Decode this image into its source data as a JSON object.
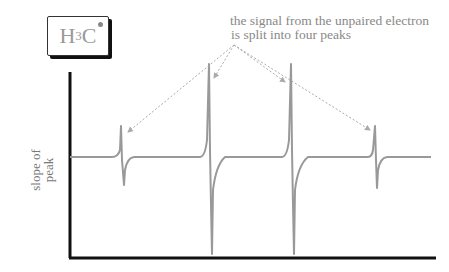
{
  "label": {
    "main": "H",
    "sub": "3",
    "tail": "C",
    "radical": "•"
  },
  "annotation": {
    "line1": "the signal from the unpaired electron",
    "line2": "is split into four peaks"
  },
  "ylabel": {
    "line1": "slope of",
    "line2": "peak"
  },
  "colors": {
    "axis": "#111111",
    "trace": "#999999",
    "arrow": "#aaaaaa",
    "text": "#888888"
  },
  "peaks": [
    {
      "x": 121,
      "relative_intensity": 1
    },
    {
      "x": 209,
      "relative_intensity": 3
    },
    {
      "x": 292,
      "relative_intensity": 3
    },
    {
      "x": 375,
      "relative_intensity": 1
    }
  ]
}
